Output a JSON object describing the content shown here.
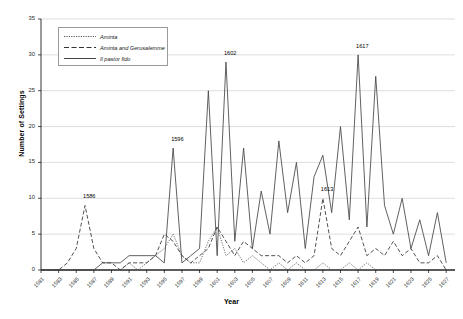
{
  "chart_data": {
    "type": "line",
    "title": "",
    "xlabel": "Year",
    "ylabel": "Number of Settings",
    "xlim": [
      1581,
      1628
    ],
    "ylim": [
      0,
      35
    ],
    "ytick_step": 5,
    "yticks": [
      0,
      5,
      10,
      15,
      20,
      25,
      30,
      35
    ],
    "xticks": [
      1581,
      1583,
      1585,
      1587,
      1589,
      1591,
      1593,
      1595,
      1597,
      1599,
      1601,
      1603,
      1605,
      1607,
      1609,
      1611,
      1613,
      1615,
      1617,
      1619,
      1621,
      1623,
      1625,
      1627
    ],
    "x": [
      1581,
      1582,
      1583,
      1584,
      1585,
      1586,
      1587,
      1588,
      1589,
      1590,
      1591,
      1592,
      1593,
      1594,
      1595,
      1596,
      1597,
      1598,
      1599,
      1600,
      1601,
      1602,
      1603,
      1604,
      1605,
      1606,
      1607,
      1608,
      1609,
      1610,
      1611,
      1612,
      1613,
      1614,
      1615,
      1616,
      1617,
      1618,
      1619,
      1620,
      1621,
      1622,
      1623,
      1624,
      1625,
      1626,
      1627
    ],
    "grid": "horizontal",
    "legend_position": "upper-left",
    "series": [
      {
        "name": "Aminta",
        "style": "dotted",
        "color": "#555555",
        "values": [
          0,
          0,
          0,
          0,
          0,
          0,
          0,
          0,
          0,
          0,
          1,
          0,
          1,
          2,
          3,
          5,
          2,
          1,
          1,
          4,
          6,
          2,
          3,
          1,
          2,
          1,
          0,
          1,
          0,
          1,
          0,
          0,
          1,
          0,
          0,
          1,
          0,
          1,
          0,
          0,
          0,
          0,
          0,
          0,
          0,
          0,
          0
        ]
      },
      {
        "name": "Aminta and Gerusalemme",
        "style": "dashed",
        "color": "#333333",
        "values": [
          0,
          0,
          0,
          1,
          3,
          9,
          3,
          1,
          1,
          0,
          1,
          1,
          1,
          2,
          5,
          4,
          2,
          1,
          2,
          3,
          6,
          4,
          2,
          4,
          3,
          2,
          2,
          2,
          1,
          2,
          1,
          2,
          10,
          3,
          2,
          4,
          6,
          2,
          3,
          2,
          4,
          2,
          3,
          1,
          1,
          2,
          0
        ]
      },
      {
        "name": "Il pastor fido",
        "style": "solid",
        "color": "#444444",
        "values": [
          0,
          0,
          0,
          0,
          0,
          0,
          0,
          1,
          1,
          1,
          2,
          2,
          2,
          2,
          1,
          17,
          1,
          2,
          3,
          25,
          2,
          29,
          4,
          17,
          3,
          11,
          5,
          18,
          8,
          15,
          3,
          13,
          16,
          8,
          20,
          7,
          30,
          6,
          27,
          9,
          5,
          10,
          3,
          7,
          2,
          8,
          1
        ]
      }
    ],
    "annotations": [
      {
        "label": "1586",
        "x": 1586,
        "y": 9,
        "series": "Aminta and Gerusalemme"
      },
      {
        "label": "1596",
        "x": 1596,
        "y": 17,
        "series": "Il pastor fido"
      },
      {
        "label": "1602",
        "x": 1602,
        "y": 29,
        "series": "Il pastor fido"
      },
      {
        "label": "1613",
        "x": 1613,
        "y": 10,
        "series": "Aminta and Gerusalemme"
      },
      {
        "label": "1617",
        "x": 1617,
        "y": 30,
        "series": "Il pastor fido"
      }
    ]
  }
}
